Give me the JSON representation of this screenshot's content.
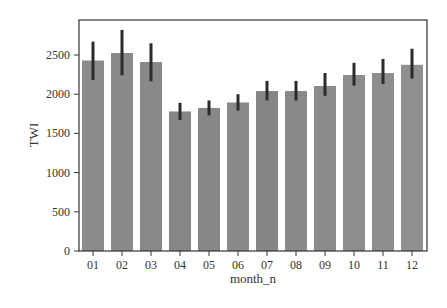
{
  "chart_data": {
    "type": "bar",
    "title": "",
    "xlabel": "month_n",
    "ylabel": "TWI",
    "ylim": [
      0,
      2880
    ],
    "yticks": [
      0,
      500,
      1000,
      1500,
      2000,
      2500
    ],
    "grid": false,
    "legend": null,
    "categories": [
      "01",
      "02",
      "03",
      "04",
      "05",
      "06",
      "07",
      "08",
      "09",
      "10",
      "11",
      "12"
    ],
    "values": [
      2430,
      2525,
      2410,
      1780,
      1825,
      1895,
      2040,
      2040,
      2105,
      2245,
      2270,
      2375
    ],
    "error_low": [
      2180,
      2240,
      2165,
      1670,
      1730,
      1790,
      1920,
      1920,
      1980,
      2110,
      2130,
      2200
    ],
    "error_high": [
      2670,
      2820,
      2650,
      1890,
      1920,
      2000,
      2170,
      2170,
      2270,
      2400,
      2450,
      2580
    ],
    "bar_colors": [
      "#8c8c8c",
      "#8a8a8a",
      "#888888",
      "#868686",
      "#878787",
      "#8a8a8a",
      "#858585",
      "#898989",
      "#8b8b8b",
      "#8d8d8d",
      "#8e8e8e",
      "#909090"
    ],
    "error_color": "#2b2b2b"
  }
}
